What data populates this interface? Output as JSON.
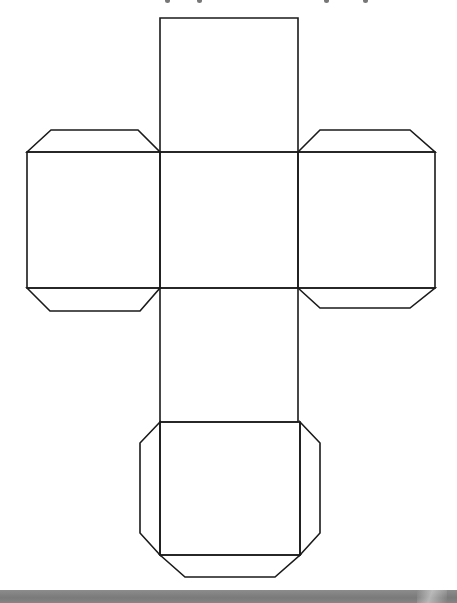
{
  "colors": {
    "background": "#ffffff",
    "stroke": "#1a1a1a",
    "band": "#808080"
  },
  "stroke_width": 1.6,
  "faces": [
    {
      "name": "top-face",
      "points": "160,18 298,18 298,152 160,152"
    },
    {
      "name": "center-face",
      "points": "160,152 298,152 298,288 160,288"
    },
    {
      "name": "lower-face",
      "points": "160,288 298,288 298,422 160,422"
    },
    {
      "name": "bottom-face",
      "points": "160,422 300,422 300,555 160,555"
    },
    {
      "name": "left-face",
      "points": "27,152 160,152 160,288 27,288"
    },
    {
      "name": "right-face",
      "points": "298,152 435,152 435,288 298,288"
    }
  ],
  "tabs": [
    {
      "name": "left-top-tab",
      "points": "27,152 51,130 138,130 160,152"
    },
    {
      "name": "left-bottom-tab",
      "points": "27,288 50,311 140,311 160,288"
    },
    {
      "name": "right-top-tab",
      "points": "298,152 320,130 410,130 435,152"
    },
    {
      "name": "right-bottom-tab",
      "points": "298,288 320,308 410,308 435,288"
    },
    {
      "name": "bottom-left-tab",
      "points": "160,422 140,443 140,533 160,555"
    },
    {
      "name": "bottom-right-tab",
      "points": "300,422 320,443 320,533 300,555"
    },
    {
      "name": "bottom-lower-tab",
      "points": "160,555 185,577 275,577 300,555"
    }
  ],
  "top_fragments_x": [
    165,
    197,
    324,
    363
  ]
}
